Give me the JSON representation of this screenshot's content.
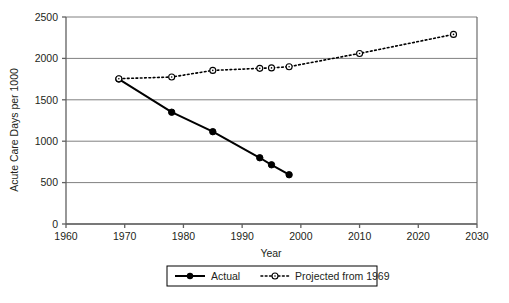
{
  "chart_data": {
    "type": "line",
    "title": "",
    "xlabel": "Year",
    "ylabel": "Acute Care Days per 1000",
    "xlim": [
      1960,
      2030
    ],
    "ylim": [
      0,
      2500
    ],
    "xticks": [
      1960,
      1970,
      1980,
      1990,
      2000,
      2010,
      2020,
      2030
    ],
    "yticks": [
      0,
      500,
      1000,
      1500,
      2000,
      2500
    ],
    "grid": "horizontal",
    "legend_position": "bottom-center",
    "series": [
      {
        "name": "Actual",
        "marker": "filled-circle",
        "linestyle": "solid",
        "color": "#000000",
        "points": [
          {
            "x": 1969,
            "y": 1750
          },
          {
            "x": 1978,
            "y": 1350
          },
          {
            "x": 1985,
            "y": 1115
          },
          {
            "x": 1993,
            "y": 800
          },
          {
            "x": 1995,
            "y": 715
          },
          {
            "x": 1998,
            "y": 595
          }
        ]
      },
      {
        "name": "Projected from 1969",
        "marker": "open-circle",
        "linestyle": "dotted",
        "color": "#000000",
        "points": [
          {
            "x": 1969,
            "y": 1755
          },
          {
            "x": 1978,
            "y": 1775
          },
          {
            "x": 1985,
            "y": 1855
          },
          {
            "x": 1993,
            "y": 1880
          },
          {
            "x": 1995,
            "y": 1885
          },
          {
            "x": 1998,
            "y": 1900
          },
          {
            "x": 2010,
            "y": 2060
          },
          {
            "x": 2026,
            "y": 2290
          }
        ]
      }
    ]
  },
  "axes": {
    "y_tick_labels": [
      "2500",
      "2000",
      "1500",
      "1000",
      "500",
      "0"
    ],
    "x_tick_labels": [
      "1960",
      "1970",
      "1980",
      "1990",
      "2000",
      "2010",
      "2020",
      "2030"
    ],
    "y_axis_title": "Acute Care Days per 1000",
    "x_axis_title": "Year"
  },
  "legend": {
    "entries": [
      {
        "label": "Actual",
        "style": "solid-filled-marker"
      },
      {
        "label": "Projected from 1969",
        "style": "dotted-open-marker"
      }
    ]
  },
  "colors": {
    "line": "#000000",
    "grid": "#808080",
    "axis": "#606060",
    "text": "#231f20",
    "background": "#ffffff"
  }
}
